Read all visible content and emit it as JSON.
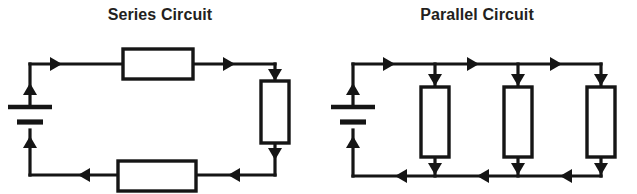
{
  "page": {
    "background_color": "#ffffff",
    "ink_color": "#151515",
    "title_color": "#231f20",
    "width": 637,
    "height": 194
  },
  "diagrams": [
    {
      "id": "series",
      "title": "Series Circuit",
      "topology": "series",
      "components": {
        "battery": {
          "count": 1,
          "position": "left",
          "orientation": "vertical"
        },
        "resistors": [
          {
            "name": "resistor-top",
            "orientation": "horizontal"
          },
          {
            "name": "resistor-right",
            "orientation": "vertical"
          },
          {
            "name": "resistor-bottom",
            "orientation": "horizontal"
          }
        ],
        "current_arrows": [
          {
            "name": "arrow-top-left",
            "direction": "right"
          },
          {
            "name": "arrow-top-right",
            "direction": "right"
          },
          {
            "name": "arrow-right-upper",
            "direction": "down"
          },
          {
            "name": "arrow-right-lower",
            "direction": "down"
          },
          {
            "name": "arrow-bottom-right",
            "direction": "left"
          },
          {
            "name": "arrow-bottom-left",
            "direction": "left"
          },
          {
            "name": "arrow-battery-upper",
            "direction": "up"
          },
          {
            "name": "arrow-battery-lower",
            "direction": "up"
          }
        ]
      }
    },
    {
      "id": "parallel",
      "title": "Parallel Circuit",
      "topology": "parallel",
      "components": {
        "battery": {
          "count": 1,
          "position": "left",
          "orientation": "vertical"
        },
        "resistors": [
          {
            "name": "resistor-branch-1",
            "orientation": "vertical"
          },
          {
            "name": "resistor-branch-2",
            "orientation": "vertical"
          },
          {
            "name": "resistor-branch-3",
            "orientation": "vertical"
          }
        ],
        "current_arrows": [
          {
            "name": "arrow-top-rail-1",
            "direction": "right"
          },
          {
            "name": "arrow-top-rail-2",
            "direction": "right"
          },
          {
            "name": "arrow-top-rail-3",
            "direction": "right"
          },
          {
            "name": "arrow-branch-1-in",
            "direction": "down"
          },
          {
            "name": "arrow-branch-2-in",
            "direction": "down"
          },
          {
            "name": "arrow-branch-3-in",
            "direction": "down"
          },
          {
            "name": "arrow-branch-1-out",
            "direction": "down"
          },
          {
            "name": "arrow-branch-2-out",
            "direction": "down"
          },
          {
            "name": "arrow-branch-3-out",
            "direction": "down"
          },
          {
            "name": "arrow-bottom-rail-1",
            "direction": "left"
          },
          {
            "name": "arrow-bottom-rail-2",
            "direction": "left"
          },
          {
            "name": "arrow-bottom-rail-3",
            "direction": "left"
          },
          {
            "name": "arrow-battery-upper",
            "direction": "up"
          },
          {
            "name": "arrow-battery-lower",
            "direction": "up"
          }
        ]
      }
    }
  ]
}
